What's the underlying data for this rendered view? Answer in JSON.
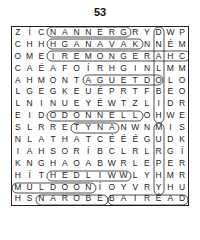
{
  "puzzle": {
    "number": "53",
    "grid": [
      [
        "Z",
        "Í",
        "C",
        "N",
        "A",
        "N",
        "N",
        "E",
        "R",
        "G",
        "R",
        "Y",
        "D",
        "W",
        "P"
      ],
      [
        "C",
        "H",
        "H",
        "H",
        "G",
        "A",
        "N",
        "A",
        "V",
        "A",
        "K",
        "N",
        "N",
        "É",
        "M"
      ],
      [
        "O",
        "M",
        "E",
        "I",
        "R",
        "E",
        "M",
        "O",
        "N",
        "G",
        "E",
        "R",
        "A",
        "H",
        "C"
      ],
      [
        "C",
        "A",
        "É",
        "A",
        "F",
        "O",
        "Í",
        "R",
        "H",
        "G",
        "I",
        "N",
        "L",
        "M",
        "M"
      ],
      [
        "A",
        "H",
        "M",
        "O",
        "N",
        "T",
        "A",
        "G",
        "U",
        "E",
        "T",
        "D",
        "O",
        "L",
        "O"
      ],
      [
        "L",
        "G",
        "E",
        "G",
        "K",
        "E",
        "U",
        "É",
        "P",
        "R",
        "T",
        "F",
        "B",
        "E",
        "O"
      ],
      [
        "L",
        "N",
        "I",
        "N",
        "U",
        "E",
        "Y",
        "É",
        "W",
        "T",
        "Z",
        "L",
        "I",
        "D",
        "R"
      ],
      [
        "E",
        "I",
        "D",
        "O",
        "D",
        "O",
        "N",
        "N",
        "E",
        "L",
        "L",
        "O",
        "H",
        "W",
        "E"
      ],
      [
        "S",
        "L",
        "R",
        "R",
        "E",
        "T",
        "Y",
        "N",
        "A",
        "N",
        "W",
        "N",
        "M",
        "I",
        "S"
      ],
      [
        "N",
        "L",
        "A",
        "T",
        "H",
        "A",
        "T",
        "C",
        "É",
        "É",
        "É",
        "G",
        "U",
        "D",
        "K"
      ],
      [
        "I",
        "A",
        "H",
        "S",
        "O",
        "R",
        "Í",
        "B",
        "C",
        "L",
        "R",
        "L",
        "R",
        "G",
        "Í"
      ],
      [
        "K",
        "N",
        "G",
        "H",
        "A",
        "O",
        "A",
        "B",
        "W",
        "R",
        "L",
        "E",
        "P",
        "E",
        "R"
      ],
      [
        "H",
        "Í",
        "T",
        "H",
        "E",
        "D",
        "L",
        "I",
        "W",
        "W",
        "L",
        "Y",
        "H",
        "M",
        "R"
      ],
      [
        "M",
        "U",
        "L",
        "D",
        "O",
        "O",
        "N",
        "Í",
        "O",
        "Y",
        "V",
        "R",
        "Y",
        "H",
        "U"
      ],
      [
        "H",
        "S",
        "N",
        "A",
        "R",
        "O",
        "B",
        "E",
        "B",
        "A",
        "I",
        "R",
        "É",
        "A",
        "D"
      ]
    ],
    "found_words": [
      "NANNERG",
      "HGANAVAK",
      "IREMONGER",
      "MONTAGUE",
      "ODONNELL",
      "TYNAN",
      "MULDOON",
      "NAROBE",
      "BAIREAD",
      "DNALOBIH",
      "MURPHY",
      "HEDLIW"
    ]
  }
}
